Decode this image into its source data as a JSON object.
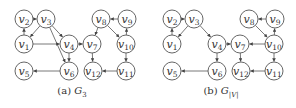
{
  "figure": {
    "panels": [
      {
        "id": "a",
        "caption_prefix": "(a)",
        "caption_symbol": "G",
        "caption_subscript": "3",
        "caption_x": 72,
        "nodes": [
          {
            "id": "v1",
            "label": "v",
            "sub": "1",
            "x": 24,
            "y": 44
          },
          {
            "id": "v2",
            "label": "v",
            "sub": "2",
            "x": 24,
            "y": 19
          },
          {
            "id": "v3",
            "label": "v",
            "sub": "3",
            "x": 46,
            "y": 19
          },
          {
            "id": "v4",
            "label": "v",
            "sub": "4",
            "x": 69,
            "y": 44
          },
          {
            "id": "v5",
            "label": "v",
            "sub": "5",
            "x": 24,
            "y": 71
          },
          {
            "id": "v6",
            "label": "v",
            "sub": "6",
            "x": 69,
            "y": 71
          },
          {
            "id": "v7",
            "label": "v",
            "sub": "7",
            "x": 92,
            "y": 44
          },
          {
            "id": "v8",
            "label": "v",
            "sub": "8",
            "x": 101,
            "y": 19
          },
          {
            "id": "v9",
            "label": "v",
            "sub": "9",
            "x": 127,
            "y": 19
          },
          {
            "id": "v10",
            "label": "v",
            "sub": "10",
            "x": 126,
            "y": 44
          },
          {
            "id": "v11",
            "label": "v",
            "sub": "11",
            "x": 126,
            "y": 71
          },
          {
            "id": "v12",
            "label": "v",
            "sub": "12",
            "x": 93,
            "y": 71
          }
        ],
        "edges": [
          [
            "v2",
            "v3"
          ],
          [
            "v1",
            "v2"
          ],
          [
            "v3",
            "v1"
          ],
          [
            "v3",
            "v4"
          ],
          [
            "v3",
            "v6"
          ],
          [
            "v1",
            "v4"
          ],
          [
            "v4",
            "v7"
          ],
          [
            "v4",
            "v6"
          ],
          [
            "v6",
            "v5"
          ],
          [
            "v9",
            "v8"
          ],
          [
            "v8",
            "v7"
          ],
          [
            "v8",
            "v10"
          ],
          [
            "v10",
            "v9"
          ],
          [
            "v10",
            "v11"
          ],
          [
            "v7",
            "v12"
          ],
          [
            "v11",
            "v12"
          ]
        ]
      },
      {
        "id": "b",
        "caption_prefix": "(b)",
        "caption_symbol": "G",
        "caption_subscript": "|V|",
        "caption_x": 221,
        "nodes": [
          {
            "id": "v1",
            "label": "v",
            "sub": "1",
            "x": 172,
            "y": 44
          },
          {
            "id": "v2",
            "label": "v",
            "sub": "2",
            "x": 172,
            "y": 19
          },
          {
            "id": "v3",
            "label": "v",
            "sub": "3",
            "x": 194,
            "y": 19
          },
          {
            "id": "v4",
            "label": "v",
            "sub": "4",
            "x": 217,
            "y": 44
          },
          {
            "id": "v5",
            "label": "v",
            "sub": "5",
            "x": 172,
            "y": 71
          },
          {
            "id": "v6",
            "label": "v",
            "sub": "6",
            "x": 217,
            "y": 71
          },
          {
            "id": "v7",
            "label": "v",
            "sub": "7",
            "x": 240,
            "y": 44
          },
          {
            "id": "v8",
            "label": "v",
            "sub": "8",
            "x": 249,
            "y": 19
          },
          {
            "id": "v9",
            "label": "v",
            "sub": "9",
            "x": 275,
            "y": 19
          },
          {
            "id": "v10",
            "label": "v",
            "sub": "10",
            "x": 274,
            "y": 44
          },
          {
            "id": "v11",
            "label": "v",
            "sub": "11",
            "x": 274,
            "y": 71
          },
          {
            "id": "v12",
            "label": "v",
            "sub": "12",
            "x": 241,
            "y": 71
          }
        ],
        "edges": [
          [
            "v2",
            "v3"
          ],
          [
            "v1",
            "v2"
          ],
          [
            "v3",
            "v1"
          ],
          [
            "v3",
            "v4"
          ],
          [
            "v4",
            "v7"
          ],
          [
            "v4",
            "v6"
          ],
          [
            "v6",
            "v5"
          ],
          [
            "v9",
            "v8"
          ],
          [
            "v8",
            "v10"
          ],
          [
            "v10",
            "v9"
          ],
          [
            "v10",
            "v7"
          ],
          [
            "v10",
            "v11"
          ],
          [
            "v7",
            "v12"
          ],
          [
            "v11",
            "v12"
          ]
        ]
      }
    ],
    "style": {
      "node_radius": 9,
      "stroke_color": "#555555",
      "text_color": "#333333",
      "background": "#ffffff"
    }
  }
}
